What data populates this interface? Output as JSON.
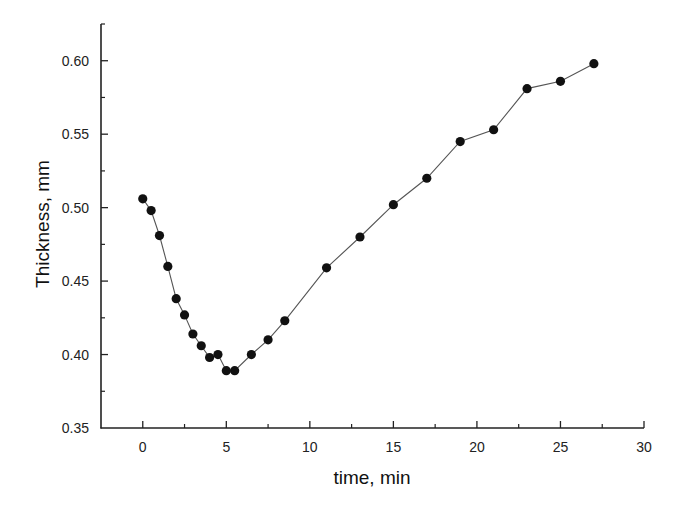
{
  "chart_data": {
    "type": "line",
    "title": "",
    "xlabel": "time, min",
    "ylabel": "Thickness, mm",
    "xlim": [
      -2.5,
      30
    ],
    "ylim": [
      0.35,
      0.625
    ],
    "x_ticks": [
      0,
      5,
      10,
      15,
      20,
      25,
      30
    ],
    "x_tick_labels": [
      "0",
      "5",
      "10",
      "15",
      "20",
      "25",
      "30"
    ],
    "y_ticks": [
      0.35,
      0.4,
      0.45,
      0.5,
      0.55,
      0.6
    ],
    "y_tick_labels": [
      "0.35",
      "0.40",
      "0.45",
      "0.50",
      "0.55",
      "0.60"
    ],
    "grid": false,
    "legend": null,
    "series": [
      {
        "name": "Thickness",
        "marker": "filled-circle",
        "line_color": "#555555",
        "marker_color": "#111111",
        "x": [
          0,
          0.5,
          1.0,
          1.5,
          2.0,
          2.5,
          3.0,
          3.5,
          4.0,
          4.5,
          5.0,
          5.5,
          6.5,
          7.5,
          8.5,
          11,
          13,
          15,
          17,
          19,
          21,
          23,
          25,
          27
        ],
        "y": [
          0.506,
          0.498,
          0.481,
          0.46,
          0.438,
          0.427,
          0.414,
          0.406,
          0.398,
          0.4,
          0.389,
          0.389,
          0.4,
          0.41,
          0.423,
          0.459,
          0.48,
          0.502,
          0.52,
          0.545,
          0.553,
          0.581,
          0.586,
          0.598
        ]
      }
    ]
  }
}
